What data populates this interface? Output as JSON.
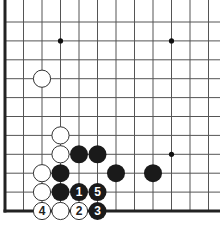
{
  "diagram": {
    "type": "go-board-corner",
    "corner": "bottom-left",
    "grid": {
      "origin_x": 5,
      "origin_y": 22,
      "spacing_x": 18.5,
      "spacing_y": 18.9,
      "cols": 12,
      "rows": 11,
      "line_color": "#555555",
      "edge_color": "#222222"
    },
    "star_points": [
      {
        "col": 3,
        "row": 1
      },
      {
        "col": 9,
        "row": 1
      },
      {
        "col": 9,
        "row": 7
      }
    ],
    "stones": [
      {
        "color": "white",
        "col": 2,
        "row": 3,
        "label": ""
      },
      {
        "color": "white",
        "col": 3,
        "row": 6,
        "label": ""
      },
      {
        "color": "white",
        "col": 3,
        "row": 7,
        "label": ""
      },
      {
        "color": "black",
        "col": 4,
        "row": 7,
        "label": ""
      },
      {
        "color": "black",
        "col": 5,
        "row": 7,
        "label": ""
      },
      {
        "color": "white",
        "col": 2,
        "row": 8,
        "label": ""
      },
      {
        "color": "black",
        "col": 3,
        "row": 8,
        "label": ""
      },
      {
        "color": "black",
        "col": 6,
        "row": 8,
        "label": ""
      },
      {
        "color": "black",
        "col": 8,
        "row": 8,
        "label": ""
      },
      {
        "color": "white",
        "col": 2,
        "row": 9,
        "label": ""
      },
      {
        "color": "black",
        "col": 3,
        "row": 9,
        "label": ""
      },
      {
        "color": "black",
        "col": 4,
        "row": 9,
        "label": "1"
      },
      {
        "color": "black",
        "col": 5,
        "row": 9,
        "label": "5"
      },
      {
        "color": "white",
        "col": 2,
        "row": 10,
        "label": "4"
      },
      {
        "color": "white",
        "col": 3,
        "row": 10,
        "label": ""
      },
      {
        "color": "white",
        "col": 4,
        "row": 10,
        "label": "2"
      },
      {
        "color": "black",
        "col": 5,
        "row": 10,
        "label": "3"
      }
    ],
    "colors": {
      "black_stone": "#1a1a1a",
      "white_stone": "#ffffff",
      "white_stroke": "#333333",
      "black_label": "#ffffff",
      "white_label": "#222222"
    }
  }
}
